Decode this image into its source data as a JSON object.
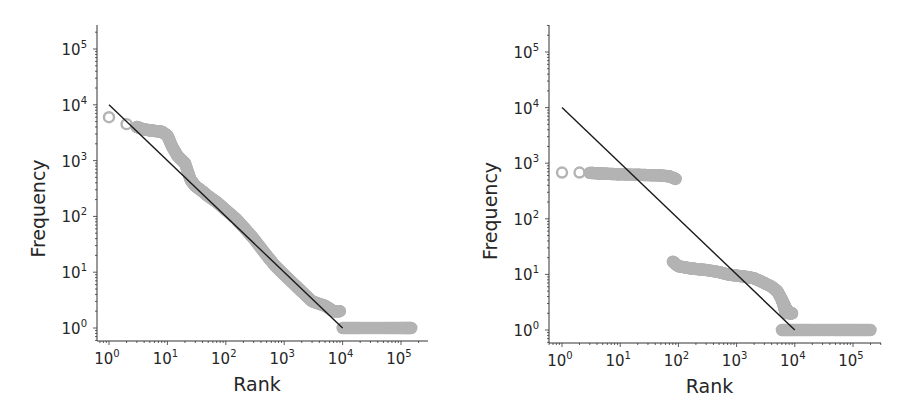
{
  "figure": {
    "panels": [
      {
        "id": "left",
        "xlabel": "Rank",
        "ylabel": "Frequency",
        "x_ticks": [
          {
            "base": "10",
            "exp": "0"
          },
          {
            "base": "10",
            "exp": "1"
          },
          {
            "base": "10",
            "exp": "2"
          },
          {
            "base": "10",
            "exp": "3"
          },
          {
            "base": "10",
            "exp": "4"
          },
          {
            "base": "10",
            "exp": "5"
          }
        ],
        "y_ticks": [
          {
            "base": "10",
            "exp": "0"
          },
          {
            "base": "10",
            "exp": "1"
          },
          {
            "base": "10",
            "exp": "2"
          },
          {
            "base": "10",
            "exp": "3"
          },
          {
            "base": "10",
            "exp": "4"
          },
          {
            "base": "10",
            "exp": "5"
          }
        ]
      },
      {
        "id": "right",
        "xlabel": "Rank",
        "ylabel": "Frequency",
        "x_ticks": [
          {
            "base": "10",
            "exp": "0"
          },
          {
            "base": "10",
            "exp": "1"
          },
          {
            "base": "10",
            "exp": "2"
          },
          {
            "base": "10",
            "exp": "3"
          },
          {
            "base": "10",
            "exp": "4"
          },
          {
            "base": "10",
            "exp": "5"
          }
        ],
        "y_ticks": [
          {
            "base": "10",
            "exp": "0"
          },
          {
            "base": "10",
            "exp": "1"
          },
          {
            "base": "10",
            "exp": "2"
          },
          {
            "base": "10",
            "exp": "3"
          },
          {
            "base": "10",
            "exp": "4"
          },
          {
            "base": "10",
            "exp": "5"
          }
        ]
      }
    ],
    "colors": {
      "markers": "#b3b3b3",
      "fit_line": "#1a1a1a",
      "axes": "#333333",
      "text": "#262626"
    }
  },
  "chart_data": [
    {
      "type": "scatter",
      "title": "",
      "xlabel": "Rank",
      "ylabel": "Frequency",
      "xscale": "log",
      "yscale": "log",
      "xlim": [
        0.6,
        300000
      ],
      "ylim": [
        0.6,
        300000
      ],
      "grid": false,
      "legend": null,
      "series": [
        {
          "name": "observed",
          "marker": "hollow circle",
          "x": [
            1,
            2,
            3,
            4,
            5,
            6,
            8,
            10,
            12,
            15,
            20,
            25,
            30,
            40,
            50,
            70,
            100,
            150,
            200,
            300,
            500,
            700,
            1000,
            1500,
            2000,
            3000,
            5000,
            7000,
            9000,
            10000,
            20000,
            50000,
            100000,
            150000
          ],
          "y": [
            6000,
            4500,
            4000,
            3600,
            3500,
            3400,
            3300,
            2800,
            1800,
            1200,
            900,
            450,
            350,
            280,
            230,
            180,
            130,
            90,
            65,
            40,
            20,
            13,
            9,
            6,
            4.5,
            3,
            2.5,
            2,
            2,
            1,
            1,
            1,
            1,
            1
          ]
        },
        {
          "name": "power-law fit",
          "type": "line",
          "x": [
            1,
            10000
          ],
          "y": [
            10000,
            1
          ]
        }
      ]
    },
    {
      "type": "scatter",
      "title": "",
      "xlabel": "Rank",
      "ylabel": "Frequency",
      "xscale": "log",
      "yscale": "log",
      "xlim": [
        0.6,
        300000
      ],
      "ylim": [
        0.6,
        300000
      ],
      "grid": false,
      "legend": null,
      "series": [
        {
          "name": "observed",
          "marker": "hollow circle",
          "x": [
            1,
            2,
            3,
            4,
            5,
            7,
            10,
            20,
            30,
            50,
            70,
            90,
            80,
            100,
            150,
            200,
            300,
            500,
            700,
            1000,
            1500,
            2000,
            3000,
            4000,
            5000,
            6000,
            7000,
            6000,
            10000,
            20000,
            50000,
            100000,
            200000
          ],
          "y": [
            680,
            680,
            670,
            660,
            650,
            640,
            630,
            620,
            610,
            600,
            580,
            520,
            17,
            14,
            13,
            12.5,
            12,
            11,
            10,
            9.5,
            9,
            8.5,
            7,
            6,
            5,
            3.5,
            2,
            1,
            1,
            1,
            1,
            1,
            1
          ]
        },
        {
          "name": "power-law fit",
          "type": "line",
          "x": [
            1,
            10000
          ],
          "y": [
            10000,
            1
          ]
        }
      ]
    }
  ]
}
